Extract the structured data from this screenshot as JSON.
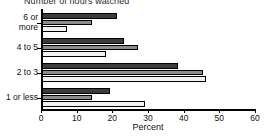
{
  "chart_data": {
    "type": "bar",
    "orientation": "horizontal",
    "title": "Number of hours watched",
    "xlabel": "Percent",
    "ylabel": "",
    "xlim": [
      0,
      60
    ],
    "xticks": [
      0,
      10,
      20,
      30,
      40,
      50,
      60
    ],
    "categories": [
      "1 or less",
      "2 to 3",
      "4 to 5",
      "6 or more"
    ],
    "grid": false,
    "legend": "none",
    "series": [
      {
        "name": "series-1",
        "color": "#3b3b3b",
        "values": [
          19,
          38,
          23,
          21
        ]
      },
      {
        "name": "series-2",
        "color": "#8c8c8c",
        "values": [
          14,
          45,
          27,
          14
        ]
      },
      {
        "name": "series-3",
        "color": "#f2f2f2",
        "values": [
          29,
          46,
          18,
          7
        ]
      }
    ]
  },
  "category_label_lines": {
    "0": [
      "1 or less"
    ],
    "1": [
      "2 to 3"
    ],
    "2": [
      "4 to 5"
    ],
    "3": [
      "6 or",
      "more"
    ]
  }
}
